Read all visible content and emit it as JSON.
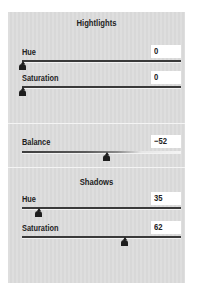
{
  "highlights": {
    "title": "Hightlights",
    "hue": {
      "label": "Hue",
      "value": "0",
      "slider_pct": 0
    },
    "saturation": {
      "label": "Saturation",
      "value": "0",
      "slider_pct": 0
    }
  },
  "balance": {
    "label": "Balance",
    "value": "−52",
    "slider_pct": 56
  },
  "shadows": {
    "title": "Shadows",
    "hue": {
      "label": "Hue",
      "value": "35",
      "slider_pct": 10
    },
    "saturation": {
      "label": "Saturation",
      "value": "62",
      "slider_pct": 85
    }
  },
  "colors": {
    "panel_bg": "#dcdcdc",
    "track": "#3a3a3a",
    "thumb": "#1e1e1e",
    "value_bg": "#ffffff"
  }
}
